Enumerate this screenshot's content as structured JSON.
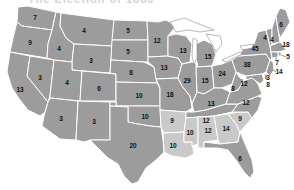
{
  "title": "The Election of 1880",
  "colors": {
    "dark_state": "#9c9c9c",
    "light_state": "#c9c9c9",
    "border": "#ffffff",
    "background": "#ffffff"
  },
  "states": [
    {
      "abbr": "WA",
      "votes": "7",
      "x": 35,
      "y": 18,
      "shade": "dark"
    },
    {
      "abbr": "OR",
      "votes": "9",
      "x": 30,
      "y": 43,
      "shade": "dark"
    },
    {
      "abbr": "CA",
      "votes": "13",
      "x": 20,
      "y": 90,
      "shade": "dark"
    },
    {
      "abbr": "NV",
      "votes": "3",
      "x": 40,
      "y": 78,
      "shade": "dark"
    },
    {
      "abbr": "ID",
      "votes": "4",
      "x": 59,
      "y": 49,
      "shade": "dark"
    },
    {
      "abbr": "MT",
      "votes": "4",
      "x": 84,
      "y": 31,
      "shade": "dark"
    },
    {
      "abbr": "WY",
      "votes": "3",
      "x": 91,
      "y": 61,
      "shade": "dark"
    },
    {
      "abbr": "UT",
      "votes": "4",
      "x": 67,
      "y": 83,
      "shade": "dark"
    },
    {
      "abbr": "CO",
      "votes": "6",
      "x": 99,
      "y": 89,
      "shade": "dark"
    },
    {
      "abbr": "AZ",
      "votes": "3",
      "x": 61,
      "y": 119,
      "shade": "dark"
    },
    {
      "abbr": "NM",
      "votes": "3",
      "x": 94,
      "y": 122,
      "shade": "dark"
    },
    {
      "abbr": "ND",
      "votes": "5",
      "x": 128,
      "y": 31,
      "shade": "dark"
    },
    {
      "abbr": "SD",
      "votes": "5",
      "x": 128,
      "y": 52,
      "shade": "dark"
    },
    {
      "abbr": "NE",
      "votes": "8",
      "x": 131,
      "y": 73,
      "shade": "dark"
    },
    {
      "abbr": "KS",
      "votes": "10",
      "x": 139,
      "y": 96,
      "shade": "dark"
    },
    {
      "abbr": "OK",
      "votes": "10",
      "x": 145,
      "y": 117,
      "shade": "dark"
    },
    {
      "abbr": "TX",
      "votes": "20",
      "x": 133,
      "y": 146,
      "shade": "dark"
    },
    {
      "abbr": "MN",
      "votes": "12",
      "x": 157,
      "y": 41,
      "shade": "dark"
    },
    {
      "abbr": "IA",
      "votes": "13",
      "x": 164,
      "y": 68,
      "shade": "dark"
    },
    {
      "abbr": "MO",
      "votes": "18",
      "x": 170,
      "y": 95,
      "shade": "dark"
    },
    {
      "abbr": "AR",
      "votes": "9",
      "x": 172,
      "y": 121,
      "shade": "light"
    },
    {
      "abbr": "LA",
      "votes": "10",
      "x": 173,
      "y": 146,
      "shade": "light"
    },
    {
      "abbr": "WI",
      "votes": "13",
      "x": 183,
      "y": 51,
      "shade": "dark"
    },
    {
      "abbr": "IL",
      "votes": "29",
      "x": 187,
      "y": 81,
      "shade": "dark"
    },
    {
      "abbr": "MI",
      "votes": "15",
      "x": 208,
      "y": 57,
      "shade": "dark"
    },
    {
      "abbr": "IN",
      "votes": "15",
      "x": 205,
      "y": 81,
      "shade": "dark"
    },
    {
      "abbr": "OH",
      "votes": "24",
      "x": 222,
      "y": 74,
      "shade": "dark"
    },
    {
      "abbr": "KY",
      "votes": "13",
      "x": 211,
      "y": 104,
      "shade": "dark"
    },
    {
      "abbr": "TN",
      "votes": "12",
      "x": 206,
      "y": 121,
      "shade": "dark"
    },
    {
      "abbr": "MS",
      "votes": "10",
      "x": 190,
      "y": 133,
      "shade": "light"
    },
    {
      "abbr": "AL",
      "votes": "12",
      "x": 208,
      "y": 131,
      "shade": "light"
    },
    {
      "abbr": "GA",
      "votes": "14",
      "x": 226,
      "y": 129,
      "shade": "light"
    },
    {
      "abbr": "SC",
      "votes": "9",
      "x": 240,
      "y": 119,
      "shade": "light"
    },
    {
      "abbr": "NC",
      "votes": "12",
      "x": 246,
      "y": 103,
      "shade": "dark"
    },
    {
      "abbr": "VA",
      "votes": "12",
      "x": 244,
      "y": 84,
      "shade": "dark"
    },
    {
      "abbr": "WV",
      "votes": "8",
      "x": 233,
      "y": 89,
      "shade": "dark"
    },
    {
      "abbr": "FL",
      "votes": "6",
      "x": 240,
      "y": 159,
      "shade": "dark"
    },
    {
      "abbr": "PA",
      "votes": "38",
      "x": 247,
      "y": 65,
      "shade": "dark"
    },
    {
      "abbr": "NY",
      "votes": "45",
      "x": 255,
      "y": 49,
      "shade": "dark"
    },
    {
      "abbr": "VT",
      "votes": "4",
      "x": 265,
      "y": 38,
      "shade": "dark"
    },
    {
      "abbr": "NH",
      "votes": "4",
      "x": 272,
      "y": 40,
      "shade": "dark"
    },
    {
      "abbr": "ME",
      "votes": "6",
      "x": 281,
      "y": 25,
      "shade": "dark"
    },
    {
      "abbr": "MA",
      "votes": "18",
      "x": 286,
      "y": 45,
      "shade": "dark"
    },
    {
      "abbr": "RI",
      "votes": "5",
      "x": 288,
      "y": 57,
      "shade": "dark"
    },
    {
      "abbr": "CT",
      "votes": "7",
      "x": 277,
      "y": 63,
      "shade": "dark"
    },
    {
      "abbr": "NJ",
      "votes": "14",
      "x": 279,
      "y": 72,
      "shade": "dark"
    },
    {
      "abbr": "DE",
      "votes": "3",
      "x": 268,
      "y": 78,
      "shade": "dark"
    },
    {
      "abbr": "MD",
      "votes": "8",
      "x": 268,
      "y": 85,
      "shade": "dark"
    }
  ]
}
